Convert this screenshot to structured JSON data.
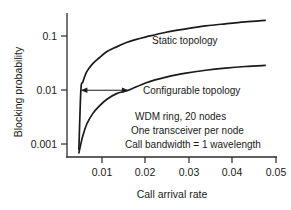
{
  "chart_data": {
    "type": "line",
    "title": "",
    "xlabel": "Call arrival rate",
    "ylabel": "Blocking probability",
    "xlim": [
      0.0,
      0.053
    ],
    "ylim": [
      0.0005,
      0.32
    ],
    "yscale": "log",
    "xscale": "linear",
    "grid": false,
    "legend": "inline-labels",
    "xticks": [
      0.01,
      0.02,
      0.03,
      0.04,
      0.05
    ],
    "xtick_labels": [
      "0.01",
      "0.02",
      "0.03",
      "0.04",
      "0.05"
    ],
    "yticks": [
      0.1,
      0.01,
      0.001
    ],
    "ytick_labels": [
      "0.1",
      "0.01",
      "0.001"
    ],
    "series": [
      {
        "name": "Static topology",
        "label": "Static topology",
        "x": [
          0.003,
          0.0035,
          0.004,
          0.005,
          0.0065,
          0.008,
          0.01,
          0.0125,
          0.015,
          0.0175,
          0.02,
          0.025,
          0.03,
          0.035,
          0.04,
          0.045,
          0.05
        ],
        "y": [
          0.0007,
          0.01,
          0.0145,
          0.023,
          0.033,
          0.042,
          0.056,
          0.07,
          0.085,
          0.098,
          0.11,
          0.135,
          0.157,
          0.179,
          0.197,
          0.215,
          0.23
        ]
      },
      {
        "name": "Configurable topology",
        "label": "Configurable topology",
        "x": [
          0.003,
          0.0035,
          0.004,
          0.005,
          0.0065,
          0.008,
          0.01,
          0.0125,
          0.0155,
          0.02,
          0.025,
          0.03,
          0.035,
          0.04,
          0.045,
          0.05
        ],
        "y": [
          0.0006,
          0.0009,
          0.0013,
          0.0022,
          0.0035,
          0.0048,
          0.0066,
          0.0086,
          0.01,
          0.014,
          0.018,
          0.0215,
          0.0245,
          0.027,
          0.029,
          0.0305
        ]
      }
    ],
    "annotations": [
      {
        "name": "gain-arrow",
        "type": "double-headed-arrow",
        "y_value": 0.01,
        "x_from": 0.0035,
        "x_to": 0.0155
      }
    ],
    "notes": [
      "WDM ring, 20 nodes",
      "One transceiver per node",
      "Call bandwidth = 1 wavelength"
    ]
  },
  "colors": {
    "curve": "#1a1a1a",
    "axis": "#2b2b2b",
    "background": "#ffffff"
  }
}
